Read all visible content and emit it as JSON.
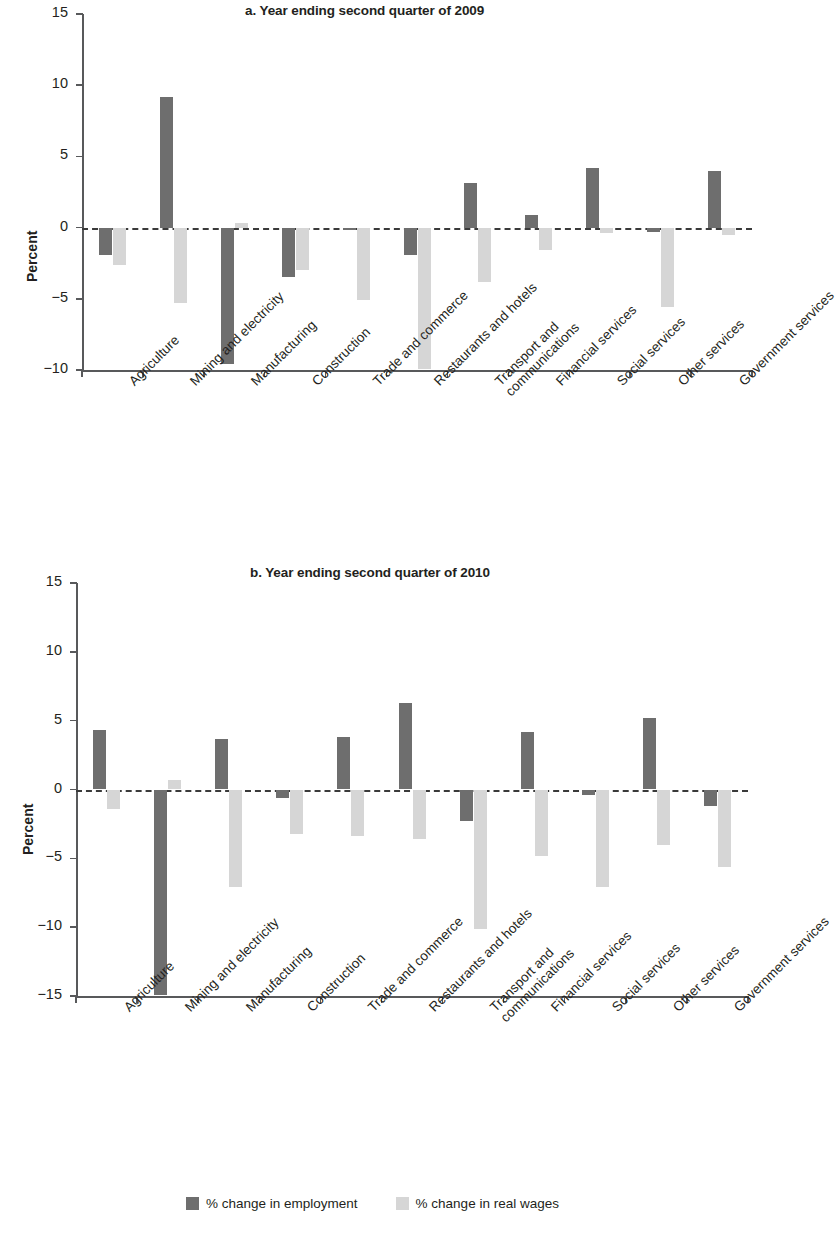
{
  "figure": {
    "ylabel": "Percent",
    "legend": {
      "employment": "% change in employment",
      "wages": "% change in real wages",
      "employment_color": "#6e6e6e",
      "wages_color": "#d6d6d6"
    }
  },
  "chart_data": [
    {
      "type": "bar",
      "title": "a. Year ending second quarter of 2009",
      "xlabel": "",
      "ylabel": "Percent",
      "ylim": [
        -10,
        15
      ],
      "yticks": [
        15,
        10,
        5,
        0,
        -5,
        -10
      ],
      "ytick_labels": [
        "15",
        "10",
        "5",
        "0",
        "−5",
        "−10"
      ],
      "grid": false,
      "legend_position": "bottom",
      "zero_line": true,
      "categories": [
        "Agriculture",
        "Mining and electricity",
        "Manufacturing",
        "Construction",
        "Trade and commerce",
        "Restaurants and hotels",
        "Transport and\ncommunications",
        "Financial services",
        "Social services",
        "Other services",
        "Government services"
      ],
      "series": [
        {
          "name": "% change in employment",
          "color": "#6e6e6e",
          "values": [
            -1.9,
            9.2,
            -9.6,
            -3.5,
            -0.2,
            -1.9,
            3.1,
            0.9,
            4.2,
            -0.3,
            4.0
          ]
        },
        {
          "name": "% change in real wages",
          "color": "#d6d6d6",
          "values": [
            -2.6,
            -5.3,
            0.3,
            -3.0,
            -5.1,
            -9.9,
            -3.8,
            -1.6,
            -0.4,
            -5.6,
            -0.5
          ]
        }
      ]
    },
    {
      "type": "bar",
      "title": "b. Year ending second quarter of 2010",
      "xlabel": "",
      "ylabel": "Percent",
      "ylim": [
        -15,
        15
      ],
      "yticks": [
        15,
        10,
        5,
        0,
        -5,
        -10,
        -15
      ],
      "ytick_labels": [
        "15",
        "10",
        "5",
        "0",
        "−5",
        "−10",
        "−15"
      ],
      "grid": false,
      "legend_position": "bottom",
      "zero_line": true,
      "categories": [
        "Agriculture",
        "Mining and electricity",
        "Manufacturing",
        "Construction",
        "Trade and commerce",
        "Restaurants and hotels",
        "Transport and\ncommunications",
        "Financial services",
        "Social services",
        "Other services",
        "Government services"
      ],
      "series": [
        {
          "name": "% change in employment",
          "color": "#6e6e6e",
          "values": [
            4.3,
            -14.9,
            3.7,
            -0.6,
            3.8,
            6.3,
            -2.3,
            4.2,
            -0.4,
            5.2,
            -1.2
          ]
        },
        {
          "name": "% change in real wages",
          "color": "#d6d6d6",
          "values": [
            -1.4,
            0.7,
            -7.1,
            -3.2,
            -3.4,
            -3.6,
            -10.1,
            -4.8,
            -7.1,
            -4.0,
            -5.6
          ]
        }
      ]
    }
  ]
}
